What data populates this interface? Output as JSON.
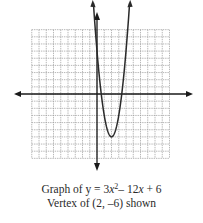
{
  "chart_data": {
    "type": "line",
    "subtitle": "Vertex of (2, -6) shown",
    "function": "y = 3x^2 - 12x + 6",
    "vertex": [
      2,
      -6
    ],
    "xlabel": "",
    "ylabel": "",
    "xlim": [
      -9,
      10
    ],
    "ylim": [
      -9,
      9
    ],
    "grid": true,
    "grid_step": 1,
    "axes_arrows": true,
    "curve_arrows": true,
    "x": [
      -0.24,
      0,
      0.5,
      1,
      1.5,
      2,
      2.5,
      3,
      3.5,
      4,
      4.24
    ],
    "y": [
      9,
      6,
      0.75,
      -3,
      -5.25,
      -6,
      -5.25,
      -3,
      0.75,
      6,
      9
    ],
    "colors": {
      "grid": "#9a9a9a",
      "axis": "#1a1a1a",
      "curve": "#2a2a2a"
    }
  },
  "caption": {
    "line1_prefix": "Graph of y = 3",
    "line1_var": "x",
    "line1_exp": "2",
    "line1_suffix": "– 12",
    "line1_var2": "x",
    "line1_end": " + 6",
    "line2": "Vertex of (2, –6) shown"
  }
}
